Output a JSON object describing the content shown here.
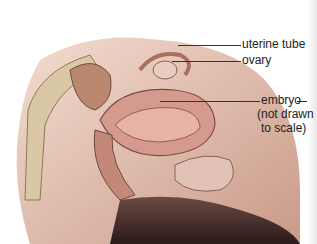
{
  "figure": {
    "labels": {
      "uterine_tube": "uterine tube",
      "ovary": "ovary",
      "embryo_line1": "embryo",
      "embryo_line2": "(not drawn",
      "embryo_line3": "to scale)"
    }
  }
}
